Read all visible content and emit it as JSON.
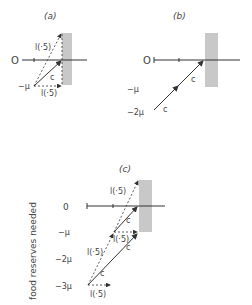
{
  "panels": {
    "a": {
      "title": "(a)",
      "axis_zero": "O",
      "neg_mu": "−μ",
      "label_upper": "l(·5)",
      "label_c": "c",
      "label_lower": "l(·5)"
    },
    "b": {
      "title": "(b)",
      "axis_zero": "O",
      "neg_mu": "−μ",
      "neg_2mu": "−2μ",
      "label_c_upper": "c",
      "label_c_lower": "c"
    },
    "c": {
      "title": "(c)",
      "y_axis_title": "food reserves needed",
      "axis_zero": "0",
      "neg_mu": "−μ",
      "neg_2mu": "−2μ",
      "neg_3mu": "−3μ",
      "label_top": "l(·5)",
      "label_mid": "l(·5)",
      "label_left": "l(·5)",
      "label_bottom": "l(·5)",
      "label_c1": "c",
      "label_c2": "c",
      "label_c3": "c"
    }
  },
  "colors": {
    "bar": "#c8c8c8",
    "line": "#333333"
  }
}
